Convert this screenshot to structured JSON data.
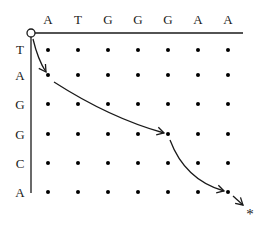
{
  "diagram": {
    "type": "sequence-alignment-dot-grid",
    "top_sequence": [
      "A",
      "T",
      "G",
      "G",
      "G",
      "A",
      "A"
    ],
    "left_sequence": [
      "T",
      "A",
      "G",
      "G",
      "C",
      "A"
    ],
    "start_marker": "open-circle",
    "end_marker": "*",
    "path": [
      {
        "from": "start",
        "to": {
          "row": 1,
          "col": 0
        }
      },
      {
        "from": {
          "row": 1,
          "col": 0
        },
        "to": {
          "row": 3,
          "col": 4
        }
      },
      {
        "from": {
          "row": 3,
          "col": 4
        },
        "to": {
          "row": 5,
          "col": 6
        }
      },
      {
        "from": {
          "row": 5,
          "col": 6
        },
        "to": "end"
      }
    ],
    "colors": {
      "line": "#1a1a1a",
      "dot": "#000000",
      "background": "#ffffff"
    }
  }
}
